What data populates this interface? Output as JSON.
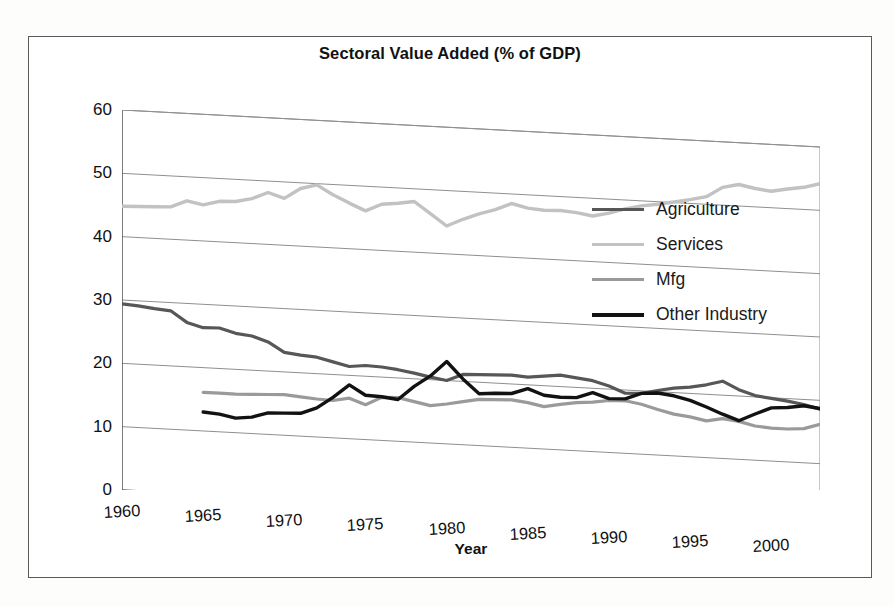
{
  "title": "Sectoral Value Added (% of GDP)",
  "axis": {
    "x_title": "Year",
    "y_ticks": [
      0,
      10,
      20,
      30,
      40,
      50,
      60
    ],
    "x_ticks": [
      1960,
      1965,
      1970,
      1975,
      1980,
      1985,
      1990,
      1995,
      2000
    ]
  },
  "legend": {
    "items": [
      {
        "label": "Agriculture",
        "color": "#575757"
      },
      {
        "label": "Services",
        "color": "#c2c2c2"
      },
      {
        "label": "Mfg",
        "color": "#9a9a9a"
      },
      {
        "label": "Other Industry",
        "color": "#121212"
      }
    ]
  },
  "chart_data": {
    "type": "line",
    "title": "Sectoral Value Added (% of GDP)",
    "xlabel": "Year",
    "ylabel": "",
    "xlim": [
      1960,
      2003
    ],
    "ylim": [
      0,
      60
    ],
    "grid": true,
    "legend_position": "inside-right",
    "x": [
      1960,
      1961,
      1962,
      1963,
      1964,
      1965,
      1966,
      1967,
      1968,
      1969,
      1970,
      1971,
      1972,
      1973,
      1974,
      1975,
      1976,
      1977,
      1978,
      1979,
      1980,
      1981,
      1982,
      1983,
      1984,
      1985,
      1986,
      1987,
      1988,
      1989,
      1990,
      1991,
      1992,
      1993,
      1994,
      1995,
      1996,
      1997,
      1998,
      1999,
      2000,
      2001,
      2002,
      2003
    ],
    "series": [
      {
        "name": "Agriculture",
        "color": "#575757",
        "values": [
          29.4,
          29.2,
          28.9,
          28.7,
          27.0,
          26.3,
          26.4,
          25.7,
          25.4,
          24.6,
          23.1,
          22.8,
          22.6,
          22.0,
          21.4,
          21.7,
          21.6,
          21.3,
          20.9,
          20.4,
          20.0,
          21.1,
          21.2,
          21.3,
          21.4,
          21.2,
          21.5,
          21.8,
          21.5,
          21.2,
          20.5,
          19.5,
          19.6,
          20.2,
          20.7,
          21.0,
          21.5,
          22.2,
          21.0,
          20.2,
          19.9,
          19.6,
          19.2,
          18.6
        ]
      },
      {
        "name": "Services",
        "color": "#c2c2c2",
        "values": [
          44.8,
          44.9,
          45.0,
          45.1,
          46.2,
          45.7,
          46.4,
          46.5,
          47.1,
          48.2,
          47.4,
          49.1,
          49.8,
          48.4,
          47.2,
          46.1,
          47.3,
          47.6,
          48.0,
          46.2,
          44.4,
          45.6,
          46.6,
          47.4,
          48.5,
          47.9,
          47.7,
          47.8,
          47.6,
          47.2,
          47.8,
          48.6,
          49.2,
          49.6,
          50.1,
          50.6,
          51.2,
          52.8,
          53.4,
          52.9,
          52.6,
          53.1,
          53.5,
          54.2
        ]
      },
      {
        "name": "Mfg",
        "color": "#9a9a9a",
        "values": [
          null,
          null,
          null,
          null,
          null,
          16.1,
          16.1,
          16.1,
          16.2,
          16.3,
          16.4,
          16.2,
          16.0,
          15.9,
          16.4,
          15.5,
          16.8,
          16.9,
          16.4,
          15.9,
          16.3,
          16.8,
          17.3,
          17.4,
          17.5,
          17.2,
          16.7,
          17.2,
          17.6,
          17.8,
          18.2,
          18.3,
          17.9,
          17.2,
          16.6,
          16.3,
          15.8,
          16.3,
          16.0,
          15.4,
          15.2,
          15.2,
          15.4,
          16.2
        ]
      },
      {
        "name": "Other Industry",
        "color": "#121212",
        "values": [
          null,
          null,
          null,
          null,
          null,
          13.0,
          12.8,
          12.3,
          12.6,
          13.4,
          13.5,
          13.6,
          14.6,
          16.4,
          18.5,
          17.0,
          16.9,
          16.6,
          18.8,
          20.6,
          23.0,
          20.4,
          18.2,
          18.4,
          18.5,
          19.4,
          18.5,
          18.3,
          18.4,
          19.3,
          18.5,
          18.6,
          19.6,
          19.8,
          19.5,
          18.9,
          18.0,
          17.0,
          16.1,
          17.3,
          18.4,
          18.6,
          19.0,
          18.7
        ]
      }
    ]
  }
}
